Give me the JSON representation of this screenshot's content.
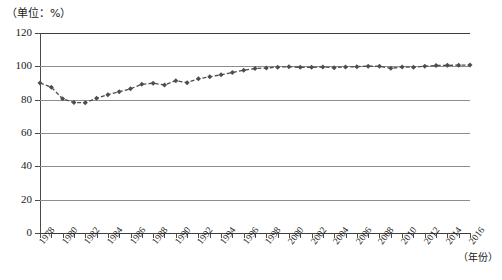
{
  "caption": {
    "unit_label": "（单位：%）"
  },
  "axes": {
    "x_title": "（年份）",
    "y_ticks": [
      "0",
      "20",
      "40",
      "60",
      "80",
      "100",
      "120"
    ],
    "x_tick_labels": [
      "1978",
      "1980",
      "1982",
      "1984",
      "1986",
      "1988",
      "1990",
      "1992",
      "1994",
      "1996",
      "1998",
      "2000",
      "2002",
      "2004",
      "2006",
      "2008",
      "2010",
      "2012",
      "2014",
      "2016"
    ]
  },
  "style": {
    "series_color": "#4d4d4d",
    "gridline_color": "#8e8e8e",
    "axis_color": "#3d3d3d",
    "background": "#ffffff"
  },
  "chart_data": {
    "type": "line",
    "title": "",
    "subtitle": "",
    "xlabel": "（年份）",
    "ylabel": "",
    "unit": "%",
    "unit_caption": "（单位：%）",
    "xlim": [
      1978,
      2016
    ],
    "ylim": [
      0,
      120
    ],
    "ytick_step": 20,
    "grid": true,
    "legend": false,
    "marker": "diamond",
    "line_style": "dashed",
    "x": [
      1978,
      1979,
      1980,
      1981,
      1982,
      1983,
      1984,
      1985,
      1986,
      1987,
      1988,
      1989,
      1990,
      1991,
      1992,
      1993,
      1994,
      1995,
      1996,
      1997,
      1998,
      1999,
      2000,
      2001,
      2002,
      2003,
      2004,
      2005,
      2006,
      2007,
      2008,
      2009,
      2010,
      2011,
      2012,
      2013,
      2014,
      2015,
      2016
    ],
    "series": [
      {
        "name": "比重",
        "values": [
          90.0,
          87.5,
          80.5,
          78.3,
          78.2,
          80.8,
          83.0,
          84.8,
          86.5,
          89.2,
          89.9,
          88.8,
          91.4,
          90.2,
          92.6,
          93.7,
          94.9,
          96.3,
          97.6,
          98.7,
          99.0,
          99.5,
          99.8,
          99.4,
          99.4,
          99.6,
          99.2,
          99.6,
          99.8,
          100.1,
          100.0,
          98.8,
          99.6,
          99.4,
          100.1,
          100.5,
          100.6,
          100.7,
          100.8
        ]
      }
    ]
  }
}
